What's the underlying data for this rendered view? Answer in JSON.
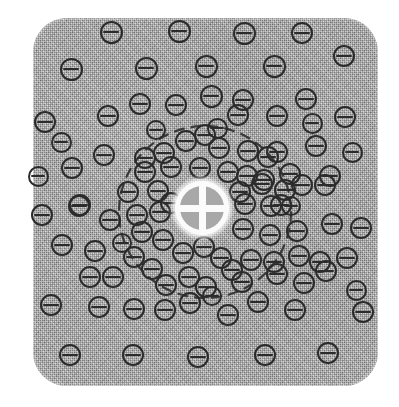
{
  "figure": {
    "type": "micrograph-schematic",
    "title": "Particle distribution field with central probe marker",
    "description": "Textured gray rounded-rectangle substrate populated with barred-circle particle symbols; a dashed circular boundary encloses a higher-density central cluster, at whose center sits a white quartered-disc probe marker.",
    "canvas": {
      "width": 399,
      "height": 407,
      "background": "#ffffff"
    }
  },
  "substrate": {
    "name": "textured-gray-field",
    "x": 33,
    "y": 18,
    "width": 345,
    "height": 368,
    "corner_radius": 34,
    "fill": "#aaaaaa",
    "texture": "halftone-dither"
  },
  "center_marker": {
    "name": "probe-marker",
    "cx": 202,
    "cy": 208,
    "radius": 27,
    "disc_color": "#fbfbfb",
    "quadrant_color": "#a8a8a8",
    "glyph": "quartered-circle"
  },
  "dashed_region": {
    "name": "cluster-boundary",
    "cx": 205,
    "cy": 212,
    "radius": 86,
    "stroke": "#3a3a3a",
    "stroke_width": 2.2,
    "dash": "9 8"
  },
  "coin_style": {
    "stroke": "#2b2b2b",
    "stroke_width": 2.6,
    "bar_width": 2.4,
    "glyph": "circle-with-horizontal-bar"
  },
  "chart_data": {
    "type": "scatter",
    "title": "Particle distribution field with central probe marker",
    "xlabel": "",
    "ylabel": "",
    "xlim": [
      0,
      399
    ],
    "ylim": [
      0,
      407
    ],
    "grid": false,
    "legend": "none",
    "marker": "circle-with-horizontal-bar",
    "annotations": [
      {
        "kind": "dashed-circle",
        "cx": 205,
        "cy": 212,
        "r": 86
      },
      {
        "kind": "probe-marker",
        "cx": 202,
        "cy": 208,
        "r": 27
      }
    ],
    "counts": {
      "total": 108,
      "inside_dashed_region": 46,
      "outside_dashed_region": 62
    },
    "points": [
      {
        "x": 111,
        "y": 32,
        "d": 23
      },
      {
        "x": 179,
        "y": 31,
        "d": 23
      },
      {
        "x": 244,
        "y": 33,
        "d": 23
      },
      {
        "x": 302,
        "y": 33,
        "d": 22
      },
      {
        "x": 344,
        "y": 56,
        "d": 22
      },
      {
        "x": 71,
        "y": 69,
        "d": 23
      },
      {
        "x": 146,
        "y": 68,
        "d": 23
      },
      {
        "x": 206,
        "y": 66,
        "d": 23
      },
      {
        "x": 274,
        "y": 66,
        "d": 23
      },
      {
        "x": 45,
        "y": 122,
        "d": 22
      },
      {
        "x": 140,
        "y": 104,
        "d": 22
      },
      {
        "x": 176,
        "y": 105,
        "d": 22
      },
      {
        "x": 211,
        "y": 96,
        "d": 23
      },
      {
        "x": 243,
        "y": 100,
        "d": 22
      },
      {
        "x": 306,
        "y": 99,
        "d": 22
      },
      {
        "x": 108,
        "y": 116,
        "d": 22
      },
      {
        "x": 238,
        "y": 115,
        "d": 22
      },
      {
        "x": 277,
        "y": 116,
        "d": 22
      },
      {
        "x": 345,
        "y": 117,
        "d": 22
      },
      {
        "x": 72,
        "y": 168,
        "d": 22
      },
      {
        "x": 104,
        "y": 155,
        "d": 22
      },
      {
        "x": 145,
        "y": 158,
        "d": 22
      },
      {
        "x": 164,
        "y": 153,
        "d": 22
      },
      {
        "x": 186,
        "y": 141,
        "d": 22
      },
      {
        "x": 205,
        "y": 135,
        "d": 22
      },
      {
        "x": 219,
        "y": 148,
        "d": 22
      },
      {
        "x": 248,
        "y": 151,
        "d": 22
      },
      {
        "x": 268,
        "y": 157,
        "d": 22
      },
      {
        "x": 277,
        "y": 152,
        "d": 22
      },
      {
        "x": 316,
        "y": 146,
        "d": 22
      },
      {
        "x": 145,
        "y": 172,
        "d": 22
      },
      {
        "x": 171,
        "y": 167,
        "d": 22
      },
      {
        "x": 200,
        "y": 168,
        "d": 22
      },
      {
        "x": 228,
        "y": 172,
        "d": 22
      },
      {
        "x": 247,
        "y": 176,
        "d": 22
      },
      {
        "x": 264,
        "y": 180,
        "d": 22
      },
      {
        "x": 290,
        "y": 174,
        "d": 22
      },
      {
        "x": 330,
        "y": 176,
        "d": 22
      },
      {
        "x": 42,
        "y": 215,
        "d": 22
      },
      {
        "x": 79,
        "y": 206,
        "d": 22
      },
      {
        "x": 128,
        "y": 192,
        "d": 22
      },
      {
        "x": 158,
        "y": 191,
        "d": 22
      },
      {
        "x": 171,
        "y": 203,
        "d": 22
      },
      {
        "x": 240,
        "y": 192,
        "d": 22
      },
      {
        "x": 262,
        "y": 184,
        "d": 22
      },
      {
        "x": 285,
        "y": 190,
        "d": 22
      },
      {
        "x": 302,
        "y": 185,
        "d": 22
      },
      {
        "x": 325,
        "y": 185,
        "d": 22
      },
      {
        "x": 137,
        "y": 215,
        "d": 22
      },
      {
        "x": 160,
        "y": 212,
        "d": 22
      },
      {
        "x": 245,
        "y": 204,
        "d": 22
      },
      {
        "x": 271,
        "y": 206,
        "d": 22
      },
      {
        "x": 281,
        "y": 205,
        "d": 22
      },
      {
        "x": 80,
        "y": 205,
        "d": 22
      },
      {
        "x": 110,
        "y": 220,
        "d": 22
      },
      {
        "x": 142,
        "y": 232,
        "d": 22
      },
      {
        "x": 163,
        "y": 240,
        "d": 22
      },
      {
        "x": 183,
        "y": 253,
        "d": 22
      },
      {
        "x": 243,
        "y": 229,
        "d": 22
      },
      {
        "x": 270,
        "y": 235,
        "d": 22
      },
      {
        "x": 297,
        "y": 231,
        "d": 22
      },
      {
        "x": 332,
        "y": 224,
        "d": 22
      },
      {
        "x": 361,
        "y": 228,
        "d": 22
      },
      {
        "x": 62,
        "y": 245,
        "d": 22
      },
      {
        "x": 95,
        "y": 251,
        "d": 22
      },
      {
        "x": 134,
        "y": 257,
        "d": 22
      },
      {
        "x": 152,
        "y": 269,
        "d": 22
      },
      {
        "x": 204,
        "y": 247,
        "d": 22
      },
      {
        "x": 221,
        "y": 258,
        "d": 22
      },
      {
        "x": 232,
        "y": 270,
        "d": 22
      },
      {
        "x": 251,
        "y": 260,
        "d": 22
      },
      {
        "x": 274,
        "y": 262,
        "d": 22
      },
      {
        "x": 299,
        "y": 256,
        "d": 22
      },
      {
        "x": 320,
        "y": 262,
        "d": 22
      },
      {
        "x": 347,
        "y": 258,
        "d": 22
      },
      {
        "x": 90,
        "y": 277,
        "d": 22
      },
      {
        "x": 113,
        "y": 277,
        "d": 22
      },
      {
        "x": 166,
        "y": 285,
        "d": 22
      },
      {
        "x": 189,
        "y": 277,
        "d": 22
      },
      {
        "x": 206,
        "y": 287,
        "d": 22
      },
      {
        "x": 242,
        "y": 282,
        "d": 22
      },
      {
        "x": 277,
        "y": 274,
        "d": 22
      },
      {
        "x": 304,
        "y": 283,
        "d": 22
      },
      {
        "x": 326,
        "y": 271,
        "d": 22
      },
      {
        "x": 51,
        "y": 305,
        "d": 22
      },
      {
        "x": 99,
        "y": 307,
        "d": 22
      },
      {
        "x": 134,
        "y": 309,
        "d": 22
      },
      {
        "x": 165,
        "y": 310,
        "d": 22
      },
      {
        "x": 190,
        "y": 303,
        "d": 22
      },
      {
        "x": 228,
        "y": 315,
        "d": 22
      },
      {
        "x": 258,
        "y": 302,
        "d": 22
      },
      {
        "x": 295,
        "y": 310,
        "d": 22
      },
      {
        "x": 363,
        "y": 312,
        "d": 22
      },
      {
        "x": 70,
        "y": 355,
        "d": 22
      },
      {
        "x": 133,
        "y": 355,
        "d": 22
      },
      {
        "x": 198,
        "y": 357,
        "d": 22
      },
      {
        "x": 265,
        "y": 355,
        "d": 22
      },
      {
        "x": 328,
        "y": 353,
        "d": 22
      },
      {
        "x": 217,
        "y": 128,
        "d": 21
      },
      {
        "x": 156,
        "y": 130,
        "d": 20
      },
      {
        "x": 291,
        "y": 206,
        "d": 20
      },
      {
        "x": 122,
        "y": 243,
        "d": 20
      },
      {
        "x": 212,
        "y": 296,
        "d": 20
      },
      {
        "x": 352,
        "y": 152,
        "d": 21
      },
      {
        "x": 38,
        "y": 176,
        "d": 21
      },
      {
        "x": 61,
        "y": 142,
        "d": 21
      },
      {
        "x": 312,
        "y": 123,
        "d": 21
      },
      {
        "x": 356,
        "y": 290,
        "d": 21
      }
    ]
  }
}
